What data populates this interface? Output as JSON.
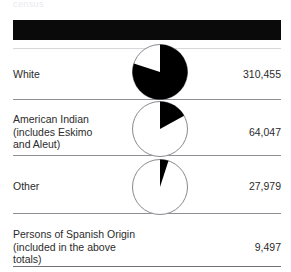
{
  "document": {
    "top_partial_text": "census",
    "header_bar": {
      "color": "#0a0a0a",
      "label": ""
    }
  },
  "table": {
    "rows": [
      {
        "label": "White",
        "value": "310,455",
        "pie": {
          "share_percent": 80,
          "filled_color": "#000000",
          "empty_color": "#ffffff"
        }
      },
      {
        "label": "American Indian\n(includes Eskimo\nand Aleut)",
        "value": "64,047",
        "pie": {
          "share_percent": 17,
          "filled_color": "#000000",
          "empty_color": "#ffffff"
        }
      },
      {
        "label": "Other",
        "value": "27,979",
        "pie": {
          "share_percent": 5,
          "filled_color": "#000000",
          "empty_color": "#ffffff"
        }
      },
      {
        "label": "Persons of Spanish Origin\n(included in the above totals)",
        "value": "9,497",
        "pie": null
      }
    ]
  },
  "chart_data": {
    "type": "pie",
    "title": "",
    "categories": [
      "White",
      "American Indian (includes Eskimo and Aleut)",
      "Other",
      "Persons of Spanish Origin (included in the above totals)"
    ],
    "values": [
      310455,
      64047,
      27979,
      9497
    ],
    "value_labels": [
      "310,455",
      "64,047",
      "27,979",
      "9,497"
    ],
    "share_percent": [
      80,
      17,
      5,
      null
    ],
    "note": "Persons of Spanish Origin is included in the above totals and has no pie glyph",
    "legend": "none",
    "grid": false
  }
}
